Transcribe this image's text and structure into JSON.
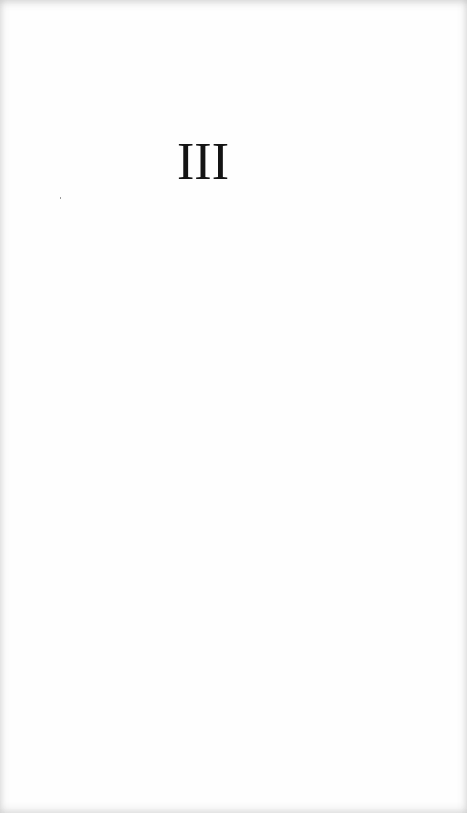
{
  "page": {
    "section_numeral": "III"
  }
}
